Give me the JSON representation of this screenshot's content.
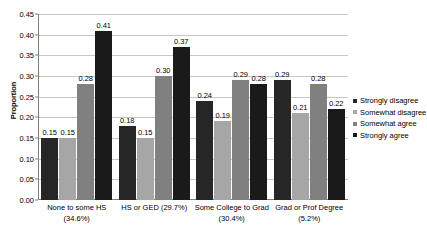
{
  "chart_data": {
    "type": "bar",
    "title": "",
    "subtitle": "",
    "xlabel": "",
    "ylabel": "Proportion",
    "ylim": [
      0,
      0.45
    ],
    "ytick_step": 0.05,
    "ytick_labels": [
      "0.00",
      "0.05",
      "0.10",
      "0.15",
      "0.20",
      "0.25",
      "0.30",
      "0.35",
      "0.40",
      "0.45"
    ],
    "ytick_values": [
      0,
      0.05,
      0.1,
      0.15,
      0.2,
      0.25,
      0.3,
      0.35,
      0.4,
      0.45
    ],
    "grid": "horizontal",
    "legend_position": "right",
    "categories": [
      "None to some HS (34.6%)",
      "HS or GED (29.7%)",
      "Some College to Grad (30.4%)",
      "Grad or Prof Degree (5.2%)"
    ],
    "category_lines": [
      [
        "None to some HS",
        "(34.6%)"
      ],
      [
        "HS or GED (29.7%)"
      ],
      [
        "Some College to Grad",
        "(30.4%)"
      ],
      [
        "Grad or Prof Degree",
        "(5.2%)"
      ]
    ],
    "series": [
      {
        "name": "Strongly disagree",
        "color": "#262626",
        "values": [
          0.15,
          0.18,
          0.24,
          0.29
        ],
        "labels": [
          "0.15",
          "0.18",
          "0.24",
          "0.29"
        ]
      },
      {
        "name": "Somewhat disagree",
        "color": "#a6a6a6",
        "values": [
          0.15,
          0.15,
          0.19,
          0.21
        ],
        "labels": [
          "0.15",
          "0.15",
          "0.19",
          "0.21"
        ]
      },
      {
        "name": "Somewhat agree",
        "color": "#808080",
        "values": [
          0.28,
          0.3,
          0.29,
          0.28
        ],
        "labels": [
          "0.28",
          "0.30",
          "0.29",
          "0.28"
        ]
      },
      {
        "name": "Strongly agree",
        "color": "#1a1a1a",
        "values": [
          0.41,
          0.37,
          0.28,
          0.22
        ],
        "labels": [
          "0.41",
          "0.37",
          "0.28",
          "0.22"
        ]
      }
    ]
  },
  "legend": {
    "items": [
      {
        "label": "Strongly disagree",
        "color": "#262626"
      },
      {
        "label": "Somewhat disagree",
        "color": "#a6a6a6"
      },
      {
        "label": "Somewhat agree",
        "color": "#808080"
      },
      {
        "label": "Strongly agree",
        "color": "#1a1a1a"
      }
    ]
  },
  "colors": {
    "gridline": "#c8c8c8",
    "axis": "#808080",
    "background": "#ffffff",
    "text": "#000000"
  }
}
